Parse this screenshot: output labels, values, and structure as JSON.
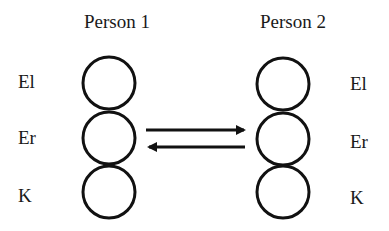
{
  "persons": [
    {
      "title": "Person 1",
      "layers": [
        "El",
        "Er",
        "K"
      ]
    },
    {
      "title": "Person 2",
      "layers": [
        "El",
        "Er",
        "K"
      ]
    }
  ],
  "arrows": [
    {
      "direction": "right",
      "from": "Person 1",
      "to": "Person 2"
    },
    {
      "direction": "left",
      "from": "Person 2",
      "to": "Person 1"
    }
  ],
  "colors": {
    "stroke": "#111111",
    "text": "#1a1a1a",
    "background": "#ffffff"
  }
}
